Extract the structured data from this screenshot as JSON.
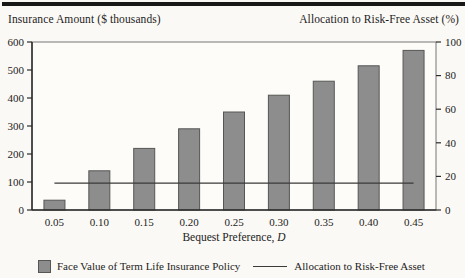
{
  "chart_data": {
    "type": "combo",
    "title_left": "Insurance Amount ($ thousands)",
    "title_right": "Allocation to Risk-Free Asset (%)",
    "xlabel_text": "Bequest Preference,",
    "xlabel_italic": "D",
    "categories": [
      "0.05",
      "0.10",
      "0.15",
      "0.20",
      "0.25",
      "0.30",
      "0.35",
      "0.40",
      "0.45"
    ],
    "series": [
      {
        "name": "Face Value of Term Life Insurance Policy",
        "type": "bar",
        "axis": "left",
        "values": [
          35,
          140,
          220,
          290,
          350,
          410,
          460,
          515,
          570
        ]
      },
      {
        "name": "Allocation to Risk-Free Asset",
        "type": "line",
        "axis": "right",
        "values": [
          16,
          16,
          16,
          16,
          16,
          16,
          16,
          16,
          16
        ]
      }
    ],
    "left_axis": {
      "min": 0,
      "max": 600,
      "ticks": [
        0,
        100,
        200,
        300,
        400,
        500,
        600
      ]
    },
    "right_axis": {
      "min": 0,
      "max": 100,
      "ticks": [
        0,
        20,
        40,
        60,
        80,
        100
      ]
    },
    "colors": {
      "bar_fill": "#8d8d8d",
      "bar_border": "#565656",
      "line": "#3a3a3a",
      "axis": "#2b2b2b",
      "frame": "#777777",
      "text": "#1c1c1c",
      "paper": "#fbf9f5"
    },
    "grid": "off",
    "legend_position": "bottom"
  }
}
